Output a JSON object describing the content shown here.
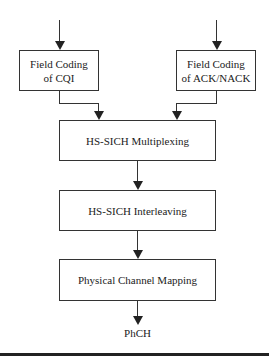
{
  "diagram": {
    "type": "flowchart",
    "boxes": {
      "cqi": "Field Coding of CQI",
      "cqi_line1": "Field Coding",
      "cqi_line2": "of CQI",
      "acknack": "Field Coding of ACK/NACK",
      "acknack_line1": "Field Coding",
      "acknack_line2": "of ACK/NACK",
      "multiplexing": "HS-SICH Multiplexing",
      "interleaving": "HS-SICH Interleaving",
      "mapping": "Physical Channel Mapping"
    },
    "output_label": "PhCH",
    "edges": [
      {
        "from": "input-left",
        "to": "cqi"
      },
      {
        "from": "input-right",
        "to": "acknack"
      },
      {
        "from": "cqi",
        "to": "multiplexing"
      },
      {
        "from": "acknack",
        "to": "multiplexing"
      },
      {
        "from": "multiplexing",
        "to": "interleaving"
      },
      {
        "from": "interleaving",
        "to": "mapping"
      },
      {
        "from": "mapping",
        "to": "PhCH"
      }
    ]
  }
}
